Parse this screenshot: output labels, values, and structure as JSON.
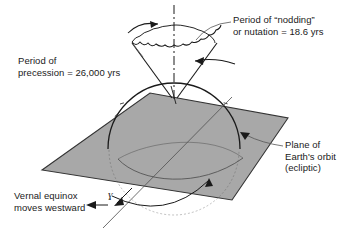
{
  "figure": {
    "background_color": "#ffffff",
    "line_color": "#1a1a1a",
    "plane_fill": "#a8a8a8",
    "plane_stroke": "#333333",
    "globe_fill": "#ffffff",
    "coastline_color": "#555555"
  },
  "labels": {
    "nutation": {
      "line1": "Period of “nodding”",
      "line2": "or nutation = 18.6 yrs"
    },
    "precession": {
      "line1": "Period of",
      "line2": "precession = 26,000 yrs"
    },
    "ecliptic": {
      "line1": "Plane of",
      "line2": "Earth's orbit",
      "line3": "(ecliptic)"
    },
    "vernal_equinox": {
      "line1": "Vernal equinox",
      "line2": "moves westward"
    },
    "aries_symbol": "ɣ"
  },
  "values": {
    "nutation_period": "18.6 yrs",
    "precession_period": "26,000 yrs"
  },
  "elements": {
    "precession_cone": "precession-cone",
    "nutation_rim": "wavy-nutation-rim",
    "ecliptic_pole_axis": "dash-dot-axis-line",
    "earth_globe": "earth-sphere",
    "ecliptic_plane": "ecliptic-plane-parallelogram",
    "equatorial_plane": "earth-equatorial-ellipse",
    "precession_arrow_left": "curved-arrow-right",
    "precession_arrow_right": "curved-arrow-left",
    "equinox_arrow": "westward-arrow"
  }
}
